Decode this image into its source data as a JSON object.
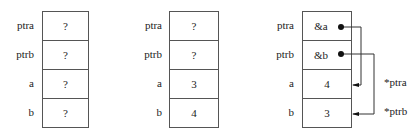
{
  "panels": [
    {
      "labels": [
        "ptra",
        "ptrb",
        "a",
        "b"
      ],
      "values": [
        "?",
        "?",
        "?",
        "?"
      ]
    },
    {
      "labels": [
        "ptra",
        "ptrb",
        "a",
        "b"
      ],
      "values": [
        "?",
        "?",
        "3",
        "4"
      ]
    },
    {
      "labels": [
        "ptra",
        "ptrb",
        "a",
        "b"
      ],
      "values": [
        "&a",
        "&b",
        "4",
        "3"
      ]
    }
  ],
  "annotations": {
    "ptra_deref": "*ptra",
    "ptrb_deref": "*ptrb"
  }
}
